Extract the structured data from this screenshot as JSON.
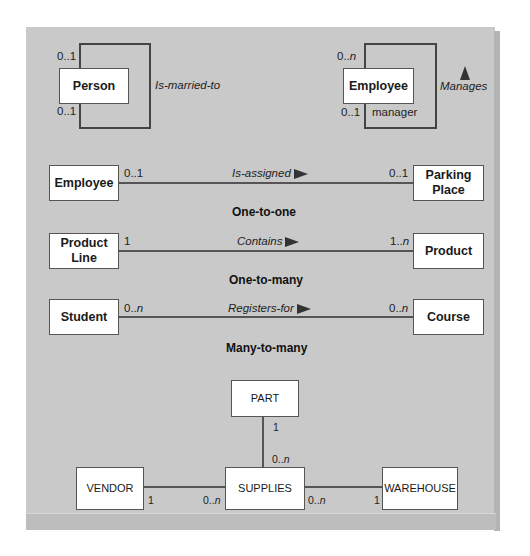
{
  "unary": {
    "person": {
      "entity": "Person",
      "top_multiplicity": "0..1",
      "bottom_multiplicity": "0..1",
      "relationship": "Is-married-to"
    },
    "employee": {
      "entity": "Employee",
      "top_multiplicity_prefix": "0..",
      "top_multiplicity_var": "n",
      "bottom_multiplicity": "0..1",
      "role": "manager",
      "relationship": "Manages"
    }
  },
  "binary": [
    {
      "left_entity": "Employee",
      "left_multiplicity": "0..1",
      "relationship": "Is-assigned",
      "right_multiplicity": "0..1",
      "right_entity": "Parking Place",
      "caption": "One-to-one"
    },
    {
      "left_entity": "Product Line",
      "left_multiplicity": "1",
      "relationship": "Contains",
      "right_multiplicity_prefix": "1..",
      "right_multiplicity_var": "n",
      "right_entity": "Product",
      "caption": "One-to-many"
    },
    {
      "left_entity": "Student",
      "left_multiplicity_prefix": "0..",
      "left_multiplicity_var": "n",
      "relationship": "Registers-for",
      "right_multiplicity_prefix": "0..",
      "right_multiplicity_var": "n",
      "right_entity": "Course",
      "caption": "Many-to-many"
    }
  ],
  "ternary": {
    "part": "PART",
    "part_multiplicity": "1",
    "supplies": "SUPPLIES",
    "supplies_top_multiplicity_prefix": "0..",
    "supplies_top_multiplicity_var": "n",
    "vendor": "VENDOR",
    "vendor_multiplicity": "1",
    "supplies_left_multiplicity_prefix": "0..",
    "supplies_left_multiplicity_var": "n",
    "supplies_right_multiplicity_prefix": "0..",
    "supplies_right_multiplicity_var": "n",
    "warehouse": "WAREHOUSE",
    "warehouse_multiplicity": "1"
  },
  "colors": {
    "panel_background": "#c9c9c9",
    "box_fill": "#ffffff",
    "line": "#555555"
  }
}
